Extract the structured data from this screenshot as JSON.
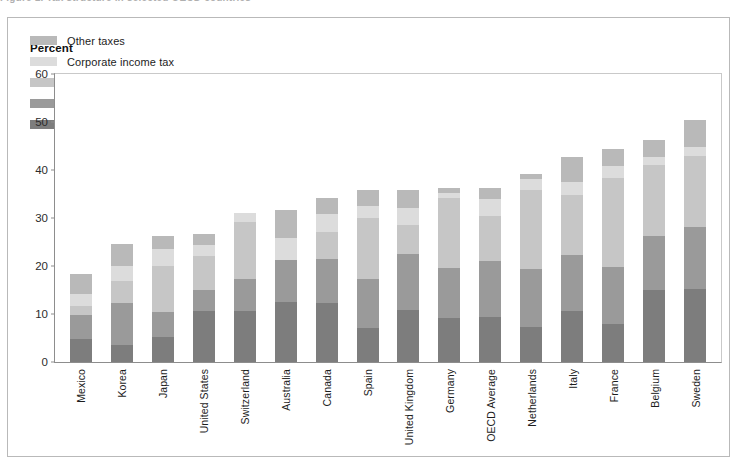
{
  "figure": {
    "title_fragment": "Figure 1.  Tax structure in selected OECD countries",
    "ylabel": "Percent"
  },
  "legend": {
    "position": "top-left",
    "items": [
      {
        "label": "Other taxes",
        "color": "#b9b9b9"
      },
      {
        "label": "Corporate income tax",
        "color": "#dcdcdc"
      },
      {
        "label": "Social Security taxes",
        "color": "#c6c6c6"
      },
      {
        "label": "Taxes on goods and services",
        "color": "#9a9a9a"
      },
      {
        "label": "Personal income tax",
        "color": "#7d7d7d"
      }
    ]
  },
  "chart_data": {
    "type": "bar",
    "subtype": "stacked",
    "title": "Tax structure in selected OECD countries",
    "xlabel": "",
    "ylabel": "Percent",
    "ylim": [
      0,
      60
    ],
    "yticks": [
      0,
      10,
      20,
      30,
      40,
      50,
      60
    ],
    "grid": false,
    "legend_position": "top-left",
    "categories": [
      "Mexico",
      "Korea",
      "Japan",
      "United States",
      "Switzerland",
      "Australia",
      "Canada",
      "Spain",
      "United Kingdom",
      "Germany",
      "OECD Average",
      "Netherlands",
      "Italy",
      "France",
      "Belgium",
      "Sweden"
    ],
    "series": [
      {
        "name": "Personal income tax",
        "color": "#7d7d7d",
        "values": [
          4.8,
          3.6,
          5.1,
          10.5,
          10.6,
          12.5,
          12.3,
          7.0,
          10.7,
          9.2,
          9.4,
          7.3,
          10.5,
          7.8,
          14.8,
          15.1
        ]
      },
      {
        "name": "Taxes on goods and services",
        "color": "#9a9a9a",
        "values": [
          5.0,
          8.6,
          5.3,
          4.5,
          6.5,
          8.7,
          9.0,
          10.2,
          11.6,
          10.3,
          11.4,
          11.9,
          11.6,
          11.8,
          11.2,
          12.8
        ]
      },
      {
        "name": "Social Security taxes",
        "color": "#c6c6c6",
        "values": [
          1.7,
          4.5,
          9.5,
          7.0,
          11.9,
          0.0,
          5.7,
          12.7,
          6.1,
          14.5,
          9.4,
          16.3,
          12.4,
          18.4,
          14.7,
          14.8
        ]
      },
      {
        "name": "Corporate income tax",
        "color": "#dcdcdc",
        "values": [
          2.5,
          3.1,
          3.5,
          2.2,
          1.9,
          4.5,
          3.6,
          2.4,
          3.4,
          1.0,
          3.5,
          2.4,
          2.7,
          2.6,
          1.8,
          1.8
        ]
      },
      {
        "name": "Other taxes",
        "color": "#b9b9b9",
        "values": [
          4.2,
          4.6,
          2.6,
          2.3,
          0.0,
          5.8,
          3.4,
          3.2,
          3.7,
          1.0,
          2.3,
          1.1,
          5.3,
          3.4,
          3.5,
          5.5
        ]
      }
    ],
    "totals": [
      18.2,
      24.4,
      26.0,
      26.5,
      30.9,
      31.5,
      34.0,
      35.5,
      35.5,
      36.0,
      36.0,
      39.0,
      42.5,
      44.0,
      46.0,
      50.0
    ]
  }
}
